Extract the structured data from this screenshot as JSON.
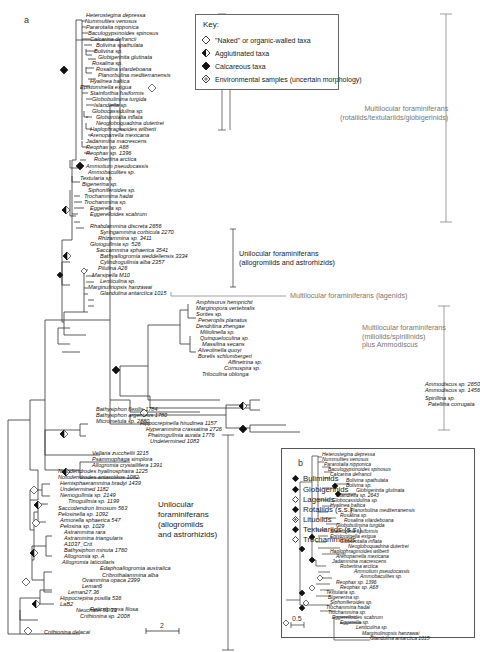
{
  "figure": {
    "panel_a_label": "a",
    "panel_b_label": "b",
    "scale_a": "2",
    "scale_b": "0.5"
  },
  "key": {
    "title": "Key:",
    "items": [
      {
        "symbol": "open-diamond",
        "label": "\"Naked\" or organic-walled taxa"
      },
      {
        "symbol": "half-filled-diamond",
        "label": "Agglutinated taxa"
      },
      {
        "symbol": "filled-diamond",
        "label": "Calcareous taxa"
      },
      {
        "symbol": "dotted-diamond",
        "label": "Environmental samples (uncertain morphology)"
      }
    ]
  },
  "groups": {
    "rotaliids_line1": "Multilocular foraminiferans",
    "rotaliids_line2": "(rotaliids/textulariids/globigerinids)",
    "unilocular_top_line1": "Unilocular foraminiferans",
    "unilocular_top_line2": "(allogromiids and astrorhizids)",
    "lagenids": "Multilocular foraminiferans (lagenids)",
    "miliolids_line1": "Multilocular foraminiferans",
    "miliolids_line2": "(miliolids/spirillinids)",
    "miliolids_line3": "plus Ammodiscus",
    "unilocular_bottom_line1": "Unilocular",
    "unilocular_bottom_line2": "foraminiferans",
    "unilocular_bottom_line3": "(allogromiids",
    "unilocular_bottom_line4": "and astrorhizids)"
  },
  "tree_a_taxa": [
    "Heterostegina depressa",
    "Nummulites venosus",
    "Pararotalia nipponica",
    "Baculogypsinoides spinosus",
    "Calcarina defrancii",
    "Bolivina spathulata",
    "Bolivina sp.",
    "Globigerinita glutinata",
    "Rosalina sp.",
    "Rosalina vilardeboana",
    "Planorbulina mediterranensis",
    "Hyalinea baltica",
    "Epistominella exigua",
    "Stainforthia fusiformis",
    "Globobulimina turgida",
    "Islandiella sp.",
    "Globocassidulina sp.",
    "Globorotalia inflata",
    "Neogloboquadrina dutertrei",
    "Haplophragmoides wilberti",
    "Arenoparrella mexicana",
    "Jadammina macrescens",
    "Reophax sp. A68",
    "Reophax sp. 1396",
    "Robertina arctica",
    "Ammotium pseudocassis",
    "Ammobaculites sp.",
    "Textularia sp.",
    "Bigenerina sp.",
    "Siphoniferoides sp.",
    "Trochammina hadai",
    "Trochammina sp.",
    "Eggerella sp.",
    "Eggerelloides scabrum",
    "Rhabdammina discreta 2656",
    "Syringammina corbicula 2270",
    "Rhizammina sp. 3411",
    "Gloiogullmia sp. 526",
    "Saccammina sphaerica 3541",
    "Bathyallogromia weddellensis 3334",
    "Cylindrogullmia alba 2357",
    "Pilulina A26",
    "Marsipella M10",
    "Lenticulina sp.",
    "Marginulinopsis hanzawai",
    "Glandulina antarctica 1015",
    "Amphisorus hemprichii",
    "Marginopora vertebralis",
    "Sorites sp.",
    "Peneroplis planatus",
    "Dendritina zhengae",
    "Miliolinella sp.",
    "Quinqueloculina sp.",
    "Massilina secans",
    "Alveolinella quoyi",
    "Borelis schlumbergeri",
    "Affinetrina sp.",
    "Cornuspira sp.",
    "Triloculina oblonga",
    "Ammodiscus sp. 2650",
    "Ammodiscus sp. 1456",
    "Spirillina sp.",
    "Patellina corrugata",
    "Bathysiphon flexilis 1784",
    "Bathysiphon argenteus 1780",
    "Micrometula sp. 2880",
    "Hippocrepinella hirudinea 1157",
    "Hyperammina crassatina 2726",
    "Phainogullmia aurata 1776",
    "Undetermined 1083",
    "Vellaria zucchellii 3215",
    "Psammophaga simplora",
    "Allogromia crystallifera 1391",
    "Notodendrodes hyalinosphaira 1225",
    "Notodendrodes antarctikos 1082",
    "Hemisphaerammina bradyi 1439",
    "Undetermined 1182",
    "Nemogullmia sp. 2149",
    "Tinogullmia sp. 1199",
    "Saccodendron limosum 563",
    "Pelosinella sp. 1092",
    "Armorella sphaerica 547",
    "Pelosina sp. 1029",
    "Astrammina rara",
    "Astrammina triangularis",
    "A1037_Crit",
    "Bathysiphon minuta 1760",
    "Allogromia sp. A",
    "Allogromia laticollaris",
    "Edaphoallogromia australica",
    "Cribrothalammina alba",
    "Ovammina opaca 2399",
    "Leman6",
    "Leman27.36",
    "Hippocrepina pusilla 536",
    "LaB2",
    "Neuchatel 51.33",
    "Crithionina sp. 2008",
    "Crithionina delacai",
    "Reticulomyxa filosa"
  ],
  "panel_b_legend": [
    {
      "symbol": "filled-diamond",
      "label": "Buliminids"
    },
    {
      "symbol": "filled-diamond",
      "label": "Globigerinids"
    },
    {
      "symbol": "open-diamond",
      "label": "Lagenids"
    },
    {
      "symbol": "filled-diamond",
      "label": "Rotaliids (s.s.)"
    },
    {
      "symbol": "dotted-diamond",
      "label": "Lituolids"
    },
    {
      "symbol": "filled-diamond",
      "label": "Textulariids (s.s.)"
    },
    {
      "symbol": "open-diamond",
      "label": "Trochamminids"
    }
  ],
  "tree_b_taxa": [
    "Heterostegina depressa",
    "Nummulites venosus",
    "Pararotalia nipponica",
    "Baculogypsinoides spinosus",
    "Calcarina defrancii",
    "Bolivina spathulata",
    "Bolivina sp.",
    "Globigerinita glutinata",
    "Islandiella sp. 2643",
    "Globocassidulina sp.",
    "Hyalinea baltica",
    "Planorbulina mediterranensis",
    "Rosalina sp.",
    "Rosalina vilardeboana",
    "Globobulimina turgida",
    "Stainforthia fusiformis",
    "Epistominella exigua",
    "Globorotalia inflata",
    "Neogloboquadrina dutertrei",
    "Haplophragmoides wilberti",
    "Arenoparrella mexicana",
    "Jadammina macrescens",
    "Robertina arctica",
    "Ammotium pseudocassis",
    "Ammobaculites sp.",
    "Reophax sp. 1396",
    "Reophax sp. A68",
    "Textularia sp.",
    "Bigenerina sp.",
    "Siphoniferoides sp.",
    "Trochammina hadai",
    "Trochammina sp.",
    "Eggerelloides scabrum",
    "Eggerella sp.",
    "Lenticulina sp.",
    "Marginulinopsis hanzawai",
    "Glandulina antarctica 1015"
  ]
}
